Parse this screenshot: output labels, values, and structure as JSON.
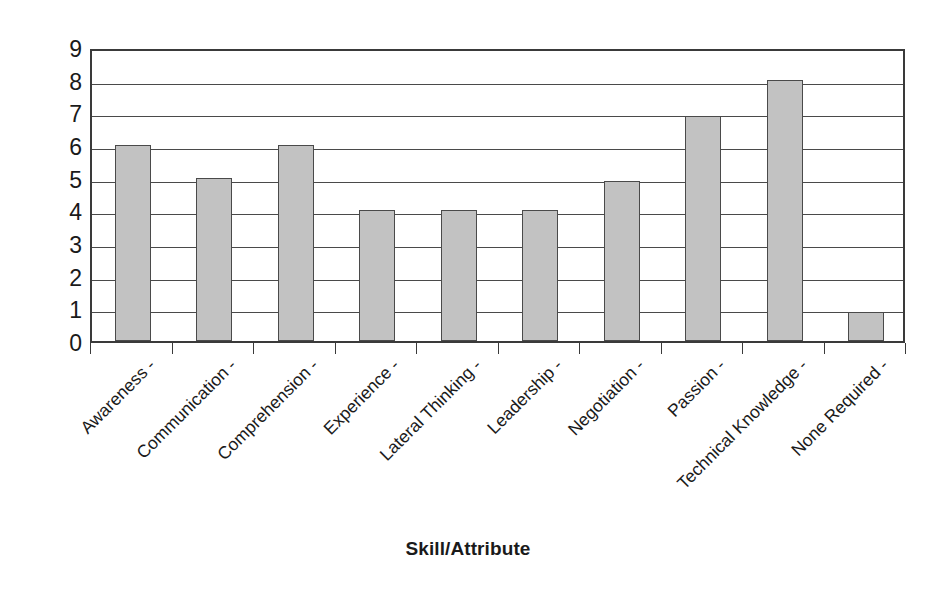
{
  "chart_data": {
    "type": "bar",
    "title": "",
    "xlabel": "Skill/Attribute",
    "ylabel": "Frequency of Mention",
    "categories": [
      "Awareness -",
      "Communication -",
      "Comprehension -",
      "Experience -",
      "Lateral Thinking -",
      "Leadership -",
      "Negotiation -",
      "Passion -",
      "Technical Knowledge -",
      "None Required -"
    ],
    "values": [
      6,
      5,
      6,
      4,
      4,
      4,
      4.9,
      6.9,
      8,
      0.9
    ],
    "ylim": [
      0,
      9
    ],
    "yticks": [
      0,
      1,
      2,
      3,
      4,
      5,
      6,
      7,
      8,
      9
    ],
    "ytick_labels": [
      "0",
      "1",
      "2",
      "3",
      "4",
      "5",
      "6",
      "7",
      "8",
      "9"
    ],
    "grid": true,
    "legend": false,
    "bar_color": "#c2c2c2",
    "bar_border_color": "#4a4a4a",
    "axis_color": "#3a3a3a",
    "background_color": "#ffffff"
  }
}
